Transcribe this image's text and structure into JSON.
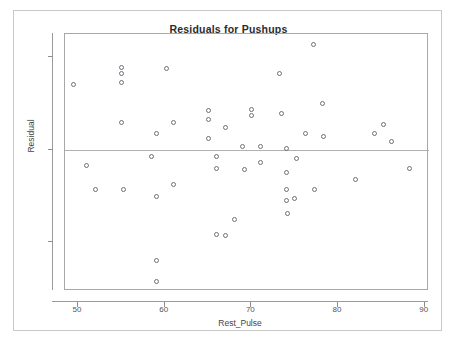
{
  "chart_data": {
    "type": "scatter",
    "title": "Residuals for Pushups",
    "xlabel": "Rest_Pulse",
    "ylabel": "Residual",
    "xlim": [
      48.5,
      90.5
    ],
    "ylim": [
      -30.5,
      25.0
    ],
    "xticks": [
      50,
      60,
      70,
      80,
      90
    ],
    "yticks": [
      20,
      0,
      -20
    ],
    "grid": false,
    "legend": null,
    "reference_line": {
      "orientation": "horizontal",
      "y": 0
    },
    "marker": {
      "shape": "open-circle",
      "color": "#6e6e78",
      "size": 5
    },
    "points": [
      {
        "x": 49.5,
        "y": 14.0
      },
      {
        "x": 51.0,
        "y": -3.5
      },
      {
        "x": 52.0,
        "y": -8.5
      },
      {
        "x": 55.0,
        "y": 17.8
      },
      {
        "x": 55.0,
        "y": 16.5
      },
      {
        "x": 55.0,
        "y": 14.5
      },
      {
        "x": 55.0,
        "y": 5.8
      },
      {
        "x": 55.2,
        "y": -8.5
      },
      {
        "x": 58.5,
        "y": -1.5
      },
      {
        "x": 59.0,
        "y": 3.5
      },
      {
        "x": 59.0,
        "y": -10.0
      },
      {
        "x": 59.0,
        "y": -24.0
      },
      {
        "x": 59.0,
        "y": -28.5
      },
      {
        "x": 60.2,
        "y": 17.5
      },
      {
        "x": 61.0,
        "y": 5.8
      },
      {
        "x": 61.0,
        "y": -7.5
      },
      {
        "x": 65.0,
        "y": 8.5
      },
      {
        "x": 65.0,
        "y": 6.5
      },
      {
        "x": 65.0,
        "y": 2.5
      },
      {
        "x": 66.0,
        "y": -1.5
      },
      {
        "x": 66.0,
        "y": -4.0
      },
      {
        "x": 66.0,
        "y": -18.3
      },
      {
        "x": 67.0,
        "y": 4.8
      },
      {
        "x": 67.0,
        "y": -18.5
      },
      {
        "x": 68.0,
        "y": -15.0
      },
      {
        "x": 69.0,
        "y": 0.8
      },
      {
        "x": 69.2,
        "y": -4.3
      },
      {
        "x": 70.0,
        "y": 8.8
      },
      {
        "x": 70.0,
        "y": 7.5
      },
      {
        "x": 71.0,
        "y": 0.8
      },
      {
        "x": 71.0,
        "y": -2.8
      },
      {
        "x": 73.2,
        "y": 16.5
      },
      {
        "x": 73.5,
        "y": 7.8
      },
      {
        "x": 74.0,
        "y": 0.2
      },
      {
        "x": 74.0,
        "y": -5.0
      },
      {
        "x": 74.0,
        "y": -8.5
      },
      {
        "x": 74.0,
        "y": -11.0
      },
      {
        "x": 74.2,
        "y": -13.8
      },
      {
        "x": 75.0,
        "y": -10.5
      },
      {
        "x": 75.2,
        "y": -1.8
      },
      {
        "x": 76.2,
        "y": 3.5
      },
      {
        "x": 77.2,
        "y": 22.8
      },
      {
        "x": 77.3,
        "y": -8.5
      },
      {
        "x": 78.2,
        "y": 10.0
      },
      {
        "x": 78.3,
        "y": 2.8
      },
      {
        "x": 82.0,
        "y": -6.5
      },
      {
        "x": 84.2,
        "y": 3.5
      },
      {
        "x": 85.2,
        "y": 5.5
      },
      {
        "x": 86.2,
        "y": 1.8
      },
      {
        "x": 88.2,
        "y": -4.0
      }
    ]
  },
  "colors": {
    "frame": "#a8a8a8",
    "axis": "#9a9a9a",
    "marker": "#6e6e78",
    "reference_line": "#b0b0b0",
    "text": "#444444",
    "title_text": "#2b2b2b",
    "background": "#ffffff"
  }
}
